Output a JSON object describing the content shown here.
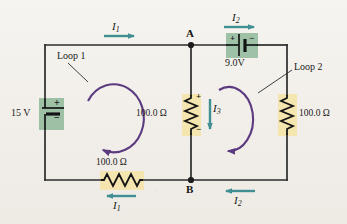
{
  "figure": {
    "type": "circuit-diagram",
    "background_color": "#f2efea"
  },
  "colors": {
    "wire": "#2b2b2b",
    "loop_arrow": "#5b3a80",
    "current_arrow": "#3f8f93",
    "battery_highlight": "#8fb89a",
    "resistor_highlight": "#f5e3a8",
    "text": "#1a1a1a"
  },
  "nodes": [
    {
      "id": "A",
      "label": "A",
      "x": 191,
      "y": 45
    },
    {
      "id": "B",
      "label": "B",
      "x": 191,
      "y": 180
    }
  ],
  "sources": [
    {
      "id": "battery-15v",
      "label": "15 V",
      "voltage": "15 V",
      "orientation": "vertical",
      "position": "left-branch",
      "plus_terminal": "top",
      "minus_terminal": "bottom",
      "plus_sign": "+",
      "minus_sign": "−"
    },
    {
      "id": "battery-9v",
      "label": "9.0V",
      "voltage": "9.0V",
      "orientation": "horizontal",
      "position": "top-right-branch",
      "plus_terminal": "left",
      "minus_terminal": "right",
      "plus_sign": "+",
      "minus_sign": "−"
    }
  ],
  "resistors": [
    {
      "id": "resistor-middle",
      "label": "100.0 Ω",
      "value": "100.0 Ω",
      "orientation": "vertical",
      "position": "middle-branch",
      "plus_sign": "+",
      "minus_sign": "−"
    },
    {
      "id": "resistor-right",
      "label": "100.0 Ω",
      "value": "100.0 Ω",
      "orientation": "vertical",
      "position": "right-branch"
    },
    {
      "id": "resistor-bottom",
      "label": "100.0 Ω",
      "value": "100.0 Ω",
      "orientation": "horizontal",
      "position": "bottom-left-branch"
    }
  ],
  "currents": [
    {
      "id": "current-i1-top",
      "symbol": "I",
      "subscript": "1",
      "direction": "right",
      "location": "top-left-wire"
    },
    {
      "id": "current-i1-bottom",
      "symbol": "I",
      "subscript": "1",
      "direction": "left",
      "location": "bottom-left-wire"
    },
    {
      "id": "current-i2-top",
      "symbol": "I",
      "subscript": "2",
      "direction": "right",
      "location": "top-right-wire"
    },
    {
      "id": "current-i2-bottom",
      "symbol": "I",
      "subscript": "2",
      "direction": "left",
      "location": "bottom-right-wire"
    },
    {
      "id": "current-i3",
      "symbol": "I",
      "subscript": "3",
      "direction": "down",
      "location": "middle-branch"
    }
  ],
  "loops": [
    {
      "id": "loop-1",
      "label": "Loop 1",
      "sense": "clockwise",
      "center_x": 112,
      "center_y": 115
    },
    {
      "id": "loop-2",
      "label": "Loop 2",
      "sense": "clockwise",
      "center_x": 238,
      "center_y": 118
    }
  ]
}
